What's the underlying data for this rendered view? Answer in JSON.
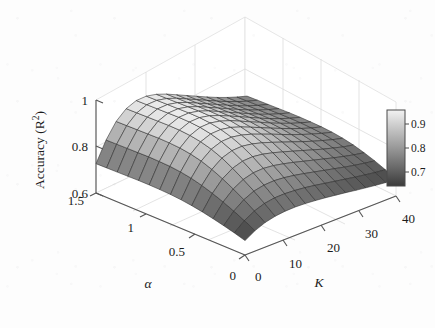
{
  "figure": {
    "background_color": "#fdfdfd",
    "width": 435,
    "height": 328
  },
  "chart_data": {
    "type": "heatmap",
    "render_as": "3d-surface-mesh",
    "title": "",
    "xlabel": "K",
    "ylabel": "α",
    "zlabel": "Accuracy (R²)",
    "xlim": [
      0,
      45
    ],
    "ylim": [
      0,
      1.5
    ],
    "zlim": [
      0.6,
      1.0
    ],
    "x_ticks": [
      0,
      10,
      20,
      30,
      40
    ],
    "x_tick_labels": [
      "0",
      "10",
      "20",
      "30",
      "40"
    ],
    "y_ticks": [
      0,
      0.5,
      1,
      1.5
    ],
    "y_tick_labels": [
      "0",
      "0.5",
      "1",
      "1.5"
    ],
    "z_ticks": [
      0.6,
      0.8,
      1.0
    ],
    "z_tick_labels": [
      "0.6",
      "0.8",
      "1"
    ],
    "grid": true,
    "colormap": "gray",
    "colorbar": {
      "position": "right",
      "ticks": [
        0.7,
        0.8,
        0.9
      ],
      "tick_labels": [
        "0.7",
        "0.8",
        "0.9"
      ],
      "vmin": 0.645,
      "vmax": 0.945,
      "top_color": "#f2f2f2",
      "bottom_color": "#3b3b3b"
    },
    "x": [
      0,
      3,
      6,
      9,
      12,
      15,
      18,
      21,
      24,
      27,
      30,
      33,
      36,
      39,
      42,
      45
    ],
    "y": [
      0,
      0.107,
      0.214,
      0.321,
      0.429,
      0.536,
      0.643,
      0.75,
      0.857,
      0.964,
      1.071,
      1.179,
      1.286,
      1.393,
      1.5
    ],
    "z": [
      [
        0.662,
        0.688,
        0.706,
        0.716,
        0.721,
        0.722,
        0.72,
        0.716,
        0.711,
        0.705,
        0.699,
        0.692,
        0.686,
        0.68,
        0.675,
        0.671
      ],
      [
        0.676,
        0.712,
        0.737,
        0.752,
        0.759,
        0.76,
        0.757,
        0.752,
        0.745,
        0.737,
        0.729,
        0.721,
        0.713,
        0.706,
        0.699,
        0.694
      ],
      [
        0.688,
        0.734,
        0.766,
        0.786,
        0.795,
        0.797,
        0.793,
        0.786,
        0.777,
        0.767,
        0.757,
        0.747,
        0.737,
        0.728,
        0.72,
        0.713
      ],
      [
        0.699,
        0.754,
        0.793,
        0.817,
        0.829,
        0.831,
        0.826,
        0.817,
        0.806,
        0.794,
        0.782,
        0.77,
        0.758,
        0.747,
        0.737,
        0.729
      ],
      [
        0.709,
        0.772,
        0.818,
        0.846,
        0.86,
        0.862,
        0.856,
        0.845,
        0.832,
        0.818,
        0.804,
        0.79,
        0.776,
        0.764,
        0.752,
        0.743
      ],
      [
        0.717,
        0.787,
        0.839,
        0.871,
        0.886,
        0.888,
        0.881,
        0.869,
        0.854,
        0.838,
        0.822,
        0.806,
        0.791,
        0.777,
        0.764,
        0.753
      ],
      [
        0.723,
        0.799,
        0.856,
        0.89,
        0.906,
        0.908,
        0.9,
        0.887,
        0.87,
        0.853,
        0.835,
        0.817,
        0.801,
        0.786,
        0.772,
        0.76
      ],
      [
        0.727,
        0.807,
        0.867,
        0.903,
        0.92,
        0.922,
        0.914,
        0.899,
        0.881,
        0.862,
        0.843,
        0.825,
        0.807,
        0.791,
        0.776,
        0.764
      ],
      [
        0.729,
        0.812,
        0.874,
        0.911,
        0.929,
        0.931,
        0.922,
        0.907,
        0.888,
        0.868,
        0.849,
        0.829,
        0.811,
        0.794,
        0.779,
        0.766
      ],
      [
        0.73,
        0.814,
        0.877,
        0.915,
        0.933,
        0.935,
        0.926,
        0.91,
        0.891,
        0.871,
        0.851,
        0.831,
        0.812,
        0.795,
        0.78,
        0.767
      ],
      [
        0.73,
        0.815,
        0.878,
        0.916,
        0.934,
        0.936,
        0.927,
        0.911,
        0.891,
        0.871,
        0.851,
        0.831,
        0.812,
        0.795,
        0.78,
        0.767
      ],
      [
        0.729,
        0.814,
        0.877,
        0.915,
        0.933,
        0.935,
        0.926,
        0.91,
        0.89,
        0.87,
        0.85,
        0.83,
        0.811,
        0.794,
        0.779,
        0.766
      ],
      [
        0.728,
        0.813,
        0.876,
        0.914,
        0.932,
        0.934,
        0.925,
        0.909,
        0.889,
        0.869,
        0.849,
        0.829,
        0.81,
        0.793,
        0.778,
        0.765
      ],
      [
        0.727,
        0.812,
        0.875,
        0.913,
        0.931,
        0.933,
        0.924,
        0.908,
        0.888,
        0.868,
        0.848,
        0.828,
        0.809,
        0.792,
        0.777,
        0.764
      ],
      [
        0.726,
        0.811,
        0.874,
        0.912,
        0.93,
        0.932,
        0.923,
        0.907,
        0.887,
        0.867,
        0.847,
        0.827,
        0.808,
        0.791,
        0.776,
        0.763
      ]
    ]
  },
  "axes": {
    "z_axis": {
      "name": "z-axis",
      "label_main": "Accuracy (R",
      "label_sup": "2",
      "label_close": ")",
      "ticks": [
        "1",
        "0.8",
        "0.6"
      ]
    },
    "y_axis": {
      "name": "alpha-axis",
      "label": "α",
      "ticks": [
        "1.5",
        "1",
        "0.5",
        "0"
      ]
    },
    "x_axis": {
      "name": "k-axis",
      "label": "K",
      "ticks": [
        "0",
        "10",
        "20",
        "30",
        "40"
      ]
    }
  },
  "colorbar": {
    "ticks": [
      "0.9",
      "0.8",
      "0.7"
    ]
  }
}
